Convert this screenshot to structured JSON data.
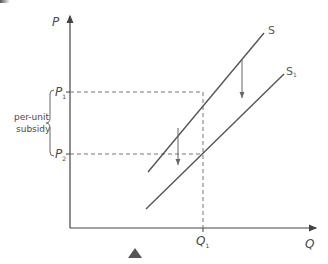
{
  "diagram": {
    "axes": {
      "y_label": "P",
      "x_label": "Q"
    },
    "price_levels": [
      {
        "label": "P",
        "subscript": "1"
      },
      {
        "label": "P",
        "subscript": "2"
      }
    ],
    "quantity_levels": [
      {
        "label": "Q",
        "subscript": "1"
      }
    ],
    "curves": [
      {
        "label": "S",
        "subscript": ""
      },
      {
        "label": "S",
        "subscript": "1"
      }
    ],
    "brace_annotation": {
      "line1": "per-unit",
      "line2": "subsidy"
    },
    "colors": {
      "line": "#555555",
      "dashed": "#777777",
      "arrow": "#666666",
      "marker": "#555555"
    }
  }
}
